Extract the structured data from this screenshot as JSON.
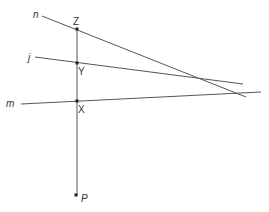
{
  "diagram": {
    "lines": [
      {
        "id": "n",
        "label": "n",
        "x1": 42,
        "y1": 16,
        "x2": 246,
        "y2": 97,
        "label_x": 33,
        "label_y": 18
      },
      {
        "id": "j",
        "label": "j",
        "x1": 35,
        "y1": 57,
        "x2": 243,
        "y2": 84,
        "label_x": 28,
        "label_y": 61
      },
      {
        "id": "m",
        "label": "m",
        "x1": 21,
        "y1": 104,
        "x2": 261,
        "y2": 92,
        "label_x": 6,
        "label_y": 107
      }
    ],
    "transversal": {
      "x1": 77,
      "y1": 29,
      "x2": 77,
      "y2": 195
    },
    "points": [
      {
        "id": "Z",
        "label": "Z",
        "x": 77,
        "y": 29,
        "label_x": 73,
        "label_y": 25
      },
      {
        "id": "Y",
        "label": "Y",
        "x": 77,
        "y": 63,
        "label_x": 78,
        "label_y": 75
      },
      {
        "id": "X",
        "label": "X",
        "x": 77,
        "y": 101,
        "label_x": 78,
        "label_y": 113
      },
      {
        "id": "P",
        "label": "P",
        "x": 76,
        "y": 195,
        "label_x": 81,
        "label_y": 202
      }
    ],
    "colors": {
      "line": "#555555",
      "point": "#222222"
    }
  }
}
